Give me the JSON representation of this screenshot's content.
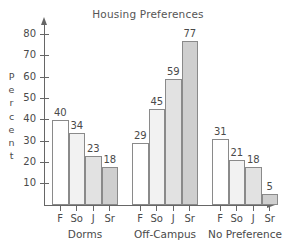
{
  "chart_data": {
    "type": "bar",
    "title": "Housing Preferences",
    "xlabel": "",
    "ylabel": "Percent",
    "ylim": [
      0,
      85
    ],
    "ytick_labels": [
      "10",
      "20",
      "30",
      "40",
      "50",
      "60",
      "70",
      "80"
    ],
    "yticks": [
      10,
      20,
      30,
      40,
      50,
      60,
      70,
      80
    ],
    "grid": false,
    "legend": "none",
    "categories": [
      "F",
      "So",
      "J",
      "Sr"
    ],
    "groups": [
      {
        "label": "Dorms",
        "bars": [
          {
            "category": "F",
            "value": 40,
            "value_label": "40",
            "fill": "#ffffff"
          },
          {
            "category": "So",
            "value": 34,
            "value_label": "34",
            "fill": "#f2f2f2"
          },
          {
            "category": "J",
            "value": 23,
            "value_label": "23",
            "fill": "#e2e2e2"
          },
          {
            "category": "Sr",
            "value": 18,
            "value_label": "18",
            "fill": "#cfcfcf"
          }
        ]
      },
      {
        "label": "Off-Campus",
        "bars": [
          {
            "category": "F",
            "value": 29,
            "value_label": "29",
            "fill": "#ffffff"
          },
          {
            "category": "So",
            "value": 45,
            "value_label": "45",
            "fill": "#f2f2f2"
          },
          {
            "category": "J",
            "value": 59,
            "value_label": "59",
            "fill": "#e2e2e2"
          },
          {
            "category": "Sr",
            "value": 77,
            "value_label": "77",
            "fill": "#cfcfcf"
          }
        ]
      },
      {
        "label": "No Preference",
        "bars": [
          {
            "category": "F",
            "value": 31,
            "value_label": "31",
            "fill": "#ffffff"
          },
          {
            "category": "So",
            "value": 21,
            "value_label": "21",
            "fill": "#f2f2f2"
          },
          {
            "category": "J",
            "value": 18,
            "value_label": "18",
            "fill": "#e2e2e2"
          },
          {
            "category": "Sr",
            "value": 5,
            "value_label": "5",
            "fill": "#cfcfcf"
          }
        ]
      }
    ],
    "ylabel_letters": [
      "P",
      "e",
      "r",
      "c",
      "e",
      "n",
      "t"
    ],
    "colors": {
      "axis": "#666666",
      "bar_outline": "#8a8a8a",
      "text": "#4a4a4a",
      "title": "#555555",
      "background": "#ffffff"
    }
  }
}
